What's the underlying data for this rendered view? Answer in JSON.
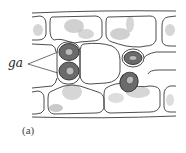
{
  "figure": {
    "labels": {
      "guard_cells": "ga",
      "panel": "(a)"
    },
    "colors": {
      "line": "#3a3a3a",
      "stipple": "#777777",
      "guard_fill": "#6b6b6b",
      "background": "#ffffff"
    }
  }
}
